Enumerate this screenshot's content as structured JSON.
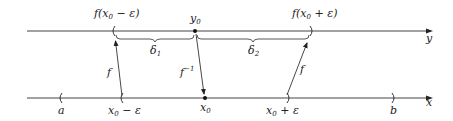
{
  "diagram": {
    "title": "",
    "top_axis": {
      "label": "y",
      "point_label": "y0",
      "left_end_label": "f(x0 − ε)",
      "right_end_label": "f(x0 + ε)"
    },
    "bottom_axis": {
      "label": "x",
      "labels": [
        "a",
        "x0 − ε",
        "x0",
        "x0 + ε",
        "b"
      ]
    },
    "braces": [
      "δ1",
      "δ2"
    ],
    "arrows": [
      "f",
      "f−1",
      "f"
    ]
  },
  "text": {
    "y_axis": "y",
    "x_axis": "x",
    "f": "f",
    "f_inv": "f",
    "f_inv_sup": "−1",
    "y0": "y",
    "y0_sub": "0",
    "fxm_pre": "f(x",
    "fxm_sub": "0",
    "fxm_post": " − ε)",
    "fxp_pre": "f(x",
    "fxp_sub": "0",
    "fxp_post": " + ε)",
    "delta": "δ",
    "d1_sub": "1",
    "d2_sub": "2",
    "a": "a",
    "b": "b",
    "x0": "x",
    "x0_sub": "0",
    "xm_pre": "x",
    "xm_sub": "0",
    "xm_post": " − ε",
    "xp_pre": "x",
    "xp_sub": "0",
    "xp_post": " + ε"
  },
  "colors": {
    "line": "#444444",
    "text": "#222222",
    "background": "#ffffff"
  }
}
